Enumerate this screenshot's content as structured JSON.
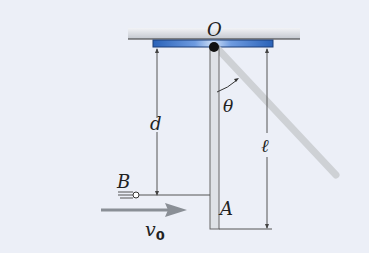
{
  "diagram": {
    "type": "physics-pendulum-collision",
    "labels": {
      "pivot": "O",
      "distance": "d",
      "angle": "θ",
      "length": "ℓ",
      "projectile": "B",
      "rod_end": "A",
      "velocity": "v",
      "velocity_subscript": "0"
    },
    "colors": {
      "background": "#eceff7",
      "ceiling": "#c8ccd4",
      "plate": "#2f6fc8",
      "plate_highlight": "#a9c6ee",
      "rod": "#d8dbe0",
      "rod_ghost": "#c9ccd0",
      "line": "#555555",
      "arrow": "#8a8f96",
      "pivot": "#111111"
    }
  }
}
